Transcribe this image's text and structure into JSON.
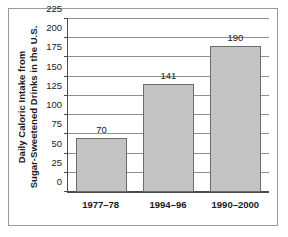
{
  "chart_data": {
    "type": "bar",
    "title": "",
    "subtitle": "",
    "xlabel": "",
    "ylabel": "Daily Caloric Intake from Sugar-Sweetened Drinks in the U.S.",
    "ylabel_lines": [
      "Daily Caloric Intake from",
      "Sugar-Sweetened Drinks in the U.S."
    ],
    "categories": [
      "1977–78",
      "1994–96",
      "1990–2000"
    ],
    "values": [
      70,
      141,
      190
    ],
    "value_labels": [
      "70",
      "141",
      "190"
    ],
    "ylim": [
      0,
      225
    ],
    "yticks": [
      0,
      25,
      50,
      75,
      100,
      125,
      150,
      175,
      200,
      225
    ],
    "ytick_labels": [
      "0",
      "25",
      "50",
      "75",
      "100",
      "125",
      "150",
      "175",
      "200",
      "225"
    ],
    "grid": "horizontal",
    "legend": "none",
    "bar_fill_color": "#c4c4c4",
    "bar_edge_color": "#6d6d6d",
    "axis_color": "#4c4c4c",
    "gridline_color": "#8f8f8f",
    "frame_color": "#9a9a9a",
    "background_color": "#ffffff",
    "text_color": "#1a1a1a"
  }
}
